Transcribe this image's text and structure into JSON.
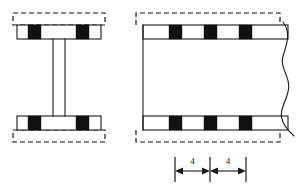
{
  "drawing": {
    "title": "Beam flange connector layout drawing",
    "background_color": "#ffffff",
    "line_color": "#1a1a1a",
    "block_color": "#111111",
    "width": 308,
    "height": 189
  },
  "views": {
    "cross_section": {
      "name": "I-beam cross section view",
      "top_flange_label": "top flange",
      "bottom_flange_label": "bottom flange",
      "web_label": "web",
      "dashed_outline_label": "cover plate outline",
      "connector_count": 4
    },
    "elevation": {
      "name": "beam elevation view",
      "top_flange_label": "top flange",
      "bottom_flange_label": "bottom flange",
      "dashed_outline_label": "cover plate outline",
      "connector_count_top": 3,
      "connector_count_bottom": 3,
      "break_symbol_label": "break line"
    }
  },
  "dimensions": [
    {
      "id": "dim-1",
      "label": "4"
    },
    {
      "id": "dim-2",
      "label": "4"
    }
  ],
  "geometry": {
    "cross_section": {
      "dashed_top": {
        "x": 13,
        "y": 13,
        "w": 92,
        "h": 12
      },
      "dashed_bottom": {
        "x": 13,
        "y": 130,
        "w": 92,
        "h": 12
      },
      "flange_top": {
        "x": 17,
        "y": 25,
        "w": 84,
        "h": 14
      },
      "flange_bottom": {
        "x": 17,
        "y": 116,
        "w": 84,
        "h": 14
      },
      "web": {
        "x": 53,
        "y": 39,
        "w": 12,
        "h": 77
      },
      "blocks": [
        {
          "x": 28,
          "y": 25,
          "w": 13,
          "h": 14
        },
        {
          "x": 76,
          "y": 25,
          "w": 13,
          "h": 14
        },
        {
          "x": 28,
          "y": 116,
          "w": 13,
          "h": 14
        },
        {
          "x": 76,
          "y": 116,
          "w": 13,
          "h": 14
        }
      ]
    },
    "elevation": {
      "dashed_top": {
        "x": 136,
        "y": 13,
        "w": 144,
        "h": 12
      },
      "dashed_bottom": {
        "x": 136,
        "y": 130,
        "w": 144,
        "h": 12
      },
      "flange_top": {
        "x": 143,
        "y": 25,
        "w": 145,
        "h": 14
      },
      "flange_bottom": {
        "x": 143,
        "y": 116,
        "w": 145,
        "h": 14
      },
      "left_edge": {
        "x": 143,
        "y": 25,
        "h": 105
      },
      "blocks_top": [
        {
          "x": 169,
          "y": 25,
          "w": 13,
          "h": 14
        },
        {
          "x": 204,
          "y": 25,
          "w": 13,
          "h": 14
        },
        {
          "x": 239,
          "y": 25,
          "w": 13,
          "h": 14
        }
      ],
      "blocks_bottom": [
        {
          "x": 169,
          "y": 116,
          "w": 13,
          "h": 14
        },
        {
          "x": 204,
          "y": 116,
          "w": 13,
          "h": 14
        },
        {
          "x": 239,
          "y": 116,
          "w": 13,
          "h": 14
        }
      ]
    },
    "dimension_line": {
      "y_axis": 171,
      "text_y": 163,
      "ticks": [
        175,
        210,
        246
      ],
      "tick_top": 155,
      "tick_bottom": 182
    }
  }
}
